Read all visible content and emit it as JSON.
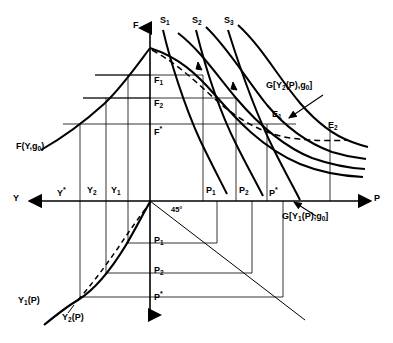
{
  "figure": {
    "background_color": "#ffffff",
    "line_color": "#000000",
    "axes": {
      "vertical_up_label": "F",
      "horizontal_right_label": "P",
      "horizontal_left_label": "Y",
      "origin_x": 150,
      "origin_y": 201
    },
    "angle_label": "45°",
    "curve_labels": {
      "supply_1": "S",
      "supply_1_sub": "1",
      "supply_2": "S",
      "supply_2_sub": "2",
      "supply_3": "S",
      "supply_3_sub": "3",
      "production_function": "F(Y,g",
      "production_function_sub": "0",
      "production_function_end": ")",
      "g_curve_upper": "G[Y",
      "g_curve_upper_sub": "2",
      "g_curve_upper_end": "(P),g",
      "g_curve_upper_sub2": "0",
      "g_curve_upper_close": "]",
      "g_curve_lower": "G[Y",
      "g_curve_lower_sub": "1",
      "g_curve_lower_end": "(P),g",
      "g_curve_lower_sub2": "0",
      "g_curve_lower_close": "]",
      "income_curve_1": "Y",
      "income_curve_1_sub": "1",
      "income_curve_1_end": "(P)",
      "income_curve_2": "Y",
      "income_curve_2_sub": "2",
      "income_curve_2_end": "(P)"
    },
    "equilibrium_points": [
      {
        "name": "E",
        "sub": "1",
        "x": 278,
        "y": 122
      },
      {
        "name": "E",
        "sub": "2",
        "x": 330,
        "y": 128
      }
    ],
    "f_axis_ticks": [
      {
        "label": "F",
        "sub": "1",
        "y": 80
      },
      {
        "label": "F",
        "sub": "2",
        "y": 103
      },
      {
        "label": "F",
        "sub": "*",
        "y": 129
      }
    ],
    "y_axis_ticks": [
      {
        "label": "Y",
        "sub": "*",
        "x": 63
      },
      {
        "label": "Y",
        "sub": "2",
        "x": 93
      },
      {
        "label": "Y",
        "sub": "1",
        "x": 117
      }
    ],
    "p_axis_ticks": [
      {
        "label": "P",
        "sub": "1",
        "x": 205
      },
      {
        "label": "P",
        "sub": "2",
        "x": 238
      },
      {
        "label": "P",
        "sub": "*",
        "x": 266
      }
    ],
    "p_vertical_ticks": [
      {
        "label": "P",
        "sub": "1",
        "y": 242
      },
      {
        "label": "P",
        "sub": "2",
        "y": 272
      },
      {
        "label": "P",
        "sub": "*",
        "y": 295
      }
    ]
  }
}
